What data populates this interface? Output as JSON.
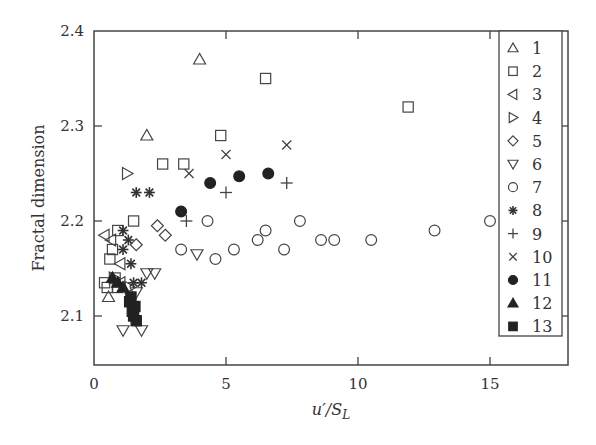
{
  "chart_data": {
    "type": "scatter",
    "title": "",
    "xlabel": "u'/S_L",
    "xlabel_parts": {
      "main": "u′/S",
      "sub": "L"
    },
    "ylabel": "Fractal dimension",
    "xlim": [
      0,
      18
    ],
    "ylim": [
      2.05,
      2.4
    ],
    "xticks": [
      0,
      5,
      10,
      15
    ],
    "xtick_labels": [
      "0",
      "5",
      "10",
      "15"
    ],
    "yticks": [
      2.1,
      2.2,
      2.3,
      2.4
    ],
    "ytick_labels": [
      "2.1",
      "2.2",
      "2.3",
      "2.4"
    ],
    "grid": false,
    "legend_position": "upper right (inside)",
    "series": [
      {
        "name": "1",
        "marker": "triangle-up",
        "filled": false,
        "points": [
          [
            4.0,
            2.37
          ],
          [
            2.0,
            2.29
          ],
          [
            0.55,
            2.12
          ]
        ]
      },
      {
        "name": "2",
        "marker": "square",
        "filled": false,
        "points": [
          [
            6.5,
            2.35
          ],
          [
            11.9,
            2.32
          ],
          [
            4.8,
            2.29
          ],
          [
            2.6,
            2.26
          ],
          [
            3.4,
            2.26
          ],
          [
            1.5,
            2.2
          ],
          [
            0.9,
            2.19
          ],
          [
            0.7,
            2.17
          ],
          [
            0.6,
            2.16
          ],
          [
            0.8,
            2.14
          ],
          [
            0.5,
            2.13
          ],
          [
            0.4,
            2.135
          ],
          [
            0.9,
            2.13
          ]
        ]
      },
      {
        "name": "3",
        "marker": "triangle-left",
        "filled": false,
        "points": [
          [
            0.4,
            2.185
          ],
          [
            0.65,
            2.18
          ],
          [
            1.0,
            2.155
          ],
          [
            1.0,
            2.135
          ]
        ]
      },
      {
        "name": "4",
        "marker": "triangle-right",
        "filled": false,
        "points": [
          [
            1.25,
            2.25
          ],
          [
            1.35,
            2.13
          ],
          [
            0.75,
            2.14
          ]
        ]
      },
      {
        "name": "5",
        "marker": "diamond",
        "filled": false,
        "points": [
          [
            2.4,
            2.195
          ],
          [
            2.7,
            2.185
          ],
          [
            1.6,
            2.175
          ]
        ]
      },
      {
        "name": "6",
        "marker": "triangle-down",
        "filled": false,
        "points": [
          [
            1.1,
            2.085
          ],
          [
            1.8,
            2.085
          ],
          [
            1.6,
            2.125
          ],
          [
            2.0,
            2.145
          ],
          [
            2.3,
            2.145
          ],
          [
            3.9,
            2.165
          ]
        ]
      },
      {
        "name": "7",
        "marker": "circle",
        "filled": false,
        "points": [
          [
            3.3,
            2.17
          ],
          [
            4.3,
            2.2
          ],
          [
            4.6,
            2.16
          ],
          [
            5.3,
            2.17
          ],
          [
            6.2,
            2.18
          ],
          [
            6.5,
            2.19
          ],
          [
            7.2,
            2.17
          ],
          [
            7.8,
            2.2
          ],
          [
            8.6,
            2.18
          ],
          [
            9.1,
            2.18
          ],
          [
            10.5,
            2.18
          ],
          [
            12.9,
            2.19
          ],
          [
            15.0,
            2.2
          ]
        ]
      },
      {
        "name": "8",
        "marker": "asterisk",
        "filled": false,
        "points": [
          [
            1.6,
            2.23
          ],
          [
            2.1,
            2.23
          ],
          [
            1.1,
            2.19
          ],
          [
            1.3,
            2.18
          ],
          [
            1.1,
            2.17
          ],
          [
            1.4,
            2.155
          ],
          [
            1.5,
            2.135
          ],
          [
            1.8,
            2.135
          ]
        ]
      },
      {
        "name": "9",
        "marker": "plus",
        "filled": false,
        "points": [
          [
            5.0,
            2.23
          ],
          [
            7.3,
            2.24
          ],
          [
            3.5,
            2.2
          ]
        ]
      },
      {
        "name": "10",
        "marker": "x",
        "filled": false,
        "points": [
          [
            5.0,
            2.27
          ],
          [
            7.3,
            2.28
          ],
          [
            3.6,
            2.25
          ]
        ]
      },
      {
        "name": "11",
        "marker": "circle",
        "filled": true,
        "points": [
          [
            3.3,
            2.21
          ],
          [
            4.4,
            2.24
          ],
          [
            5.5,
            2.247
          ],
          [
            6.6,
            2.25
          ]
        ]
      },
      {
        "name": "12",
        "marker": "triangle-up",
        "filled": true,
        "points": [
          [
            0.9,
            2.135
          ],
          [
            1.1,
            2.13
          ],
          [
            0.7,
            2.14
          ]
        ]
      },
      {
        "name": "13",
        "marker": "square",
        "filled": true,
        "points": [
          [
            1.35,
            2.115
          ],
          [
            1.45,
            2.105
          ],
          [
            1.5,
            2.1
          ],
          [
            1.6,
            2.095
          ],
          [
            1.55,
            2.11
          ],
          [
            1.4,
            2.12
          ]
        ]
      }
    ]
  }
}
